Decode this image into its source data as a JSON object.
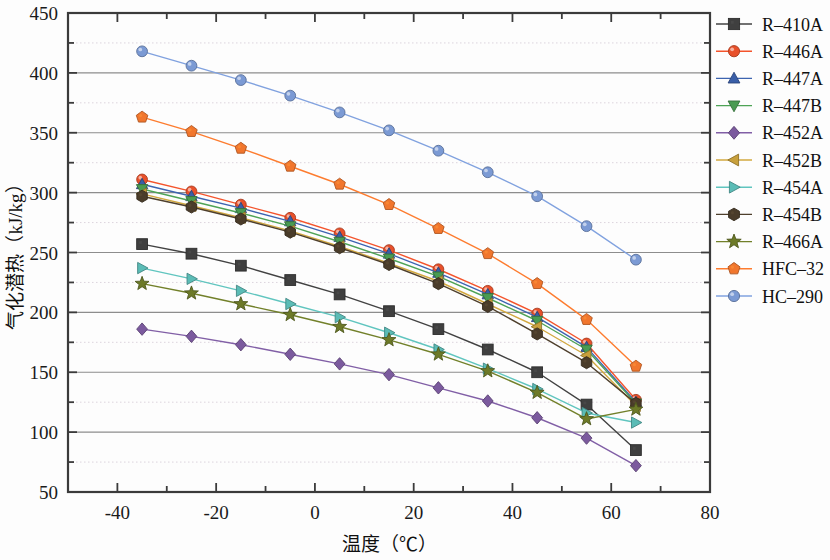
{
  "chart_data": {
    "type": "line",
    "title": "",
    "xlabel": "温度（℃）",
    "ylabel": "气化潜热（kJ/kg）",
    "xlim": [
      -50,
      80
    ],
    "ylim": [
      50,
      450
    ],
    "xticks": [
      -40,
      -20,
      0,
      20,
      40,
      60,
      80
    ],
    "yticks": [
      50,
      100,
      150,
      200,
      250,
      300,
      350,
      400,
      450
    ],
    "xtick_labels": [
      "-40",
      "-20",
      "0",
      "20",
      "40",
      "60",
      "80"
    ],
    "ytick_labels": [
      "50",
      "100",
      "150",
      "200",
      "250",
      "300",
      "350",
      "400",
      "450"
    ],
    "x_minor_step": 10,
    "y_minor_step": 25,
    "grid": "major solid gray, minor dotted light",
    "legend_position": "right",
    "x": [
      -35,
      -25,
      -15,
      -5,
      5,
      15,
      25,
      35,
      45,
      55,
      65
    ],
    "series": [
      {
        "name": "R-410A",
        "marker": "square",
        "color": "#3f3f3f",
        "values": [
          257,
          249,
          239,
          227,
          215,
          201,
          186,
          169,
          150,
          123,
          85
        ]
      },
      {
        "name": "R-446A",
        "marker": "circle",
        "color": "#e8502a",
        "values": [
          311,
          301,
          290,
          279,
          266,
          252,
          236,
          218,
          199,
          174,
          127
        ]
      },
      {
        "name": "R-447A",
        "marker": "triangle-up",
        "color": "#3a5fa8",
        "values": [
          307,
          297,
          287,
          276,
          263,
          249,
          233,
          215,
          196,
          171,
          125
        ]
      },
      {
        "name": "R-447B",
        "marker": "triangle-down",
        "color": "#4a9b52",
        "values": [
          303,
          293,
          283,
          272,
          259,
          245,
          230,
          212,
          193,
          169,
          124
        ]
      },
      {
        "name": "R-452A",
        "marker": "diamond",
        "color": "#7b5a9e",
        "values": [
          186,
          180,
          173,
          165,
          157,
          148,
          137,
          126,
          112,
          95,
          72
        ]
      },
      {
        "name": "R-452B",
        "marker": "triangle-left",
        "color": "#c8a03c",
        "values": [
          299,
          289,
          279,
          268,
          255,
          241,
          226,
          207,
          188,
          164,
          122
        ]
      },
      {
        "name": "R-454A",
        "marker": "triangle-right",
        "color": "#5bbcb6",
        "values": [
          237,
          228,
          218,
          207,
          196,
          183,
          169,
          153,
          136,
          116,
          108
        ]
      },
      {
        "name": "R-454B",
        "marker": "hexagon",
        "color": "#4a3c2a",
        "values": [
          297,
          288,
          278,
          267,
          254,
          240,
          224,
          205,
          182,
          158,
          124
        ]
      },
      {
        "name": "R-466A",
        "marker": "star",
        "color": "#6d7a28",
        "values": [
          224,
          216,
          207,
          198,
          188,
          177,
          165,
          151,
          133,
          111,
          119
        ]
      },
      {
        "name": "HFC-32",
        "marker": "pentagon",
        "color": "#f1762d",
        "values": [
          363,
          351,
          337,
          322,
          307,
          290,
          270,
          249,
          224,
          194,
          155
        ]
      },
      {
        "name": "HC-290",
        "marker": "sphere",
        "color": "#7b9ad4",
        "values": [
          418,
          406,
          394,
          381,
          367,
          352,
          335,
          317,
          297,
          272,
          244
        ]
      }
    ]
  },
  "axis": {
    "xlabel": "温度（℃）",
    "ylabel": "气化潜热（kJ/kg）"
  }
}
